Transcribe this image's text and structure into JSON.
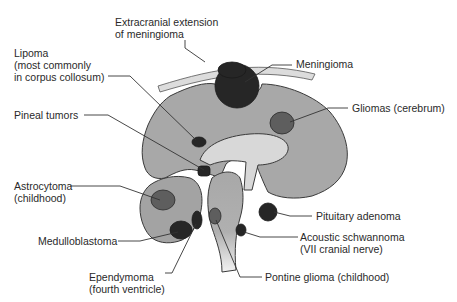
{
  "colors": {
    "brain_tissue": "#a8a8a8",
    "dark_tumor": "#262626",
    "medium_tumor": "#5e5e5e",
    "ventricle": "#d8d8d8",
    "label_text": "#2a2a2a"
  },
  "labels": {
    "extracranial": [
      "Extracranial extension",
      "of meningioma"
    ],
    "meningioma": "Meningioma",
    "lipoma": [
      "Lipoma",
      "(most commonly",
      "in corpus collosum)"
    ],
    "gliomas": "Gliomas (cerebrum)",
    "pineal": "Pineal tumors",
    "astrocytoma": [
      "Astrocytoma",
      "(childhood)"
    ],
    "pituitary": "Pituitary adenoma",
    "medulloblastoma": "Medulloblastoma",
    "acoustic": [
      "Acoustic schwannoma",
      "(VII cranial nerve)"
    ],
    "ependymoma": [
      "Ependymoma",
      "(fourth ventricle)"
    ],
    "pontine": "Pontine glioma (childhood)"
  }
}
